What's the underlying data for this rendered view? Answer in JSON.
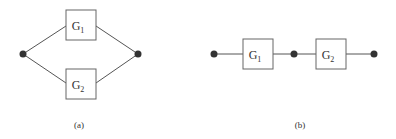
{
  "colors": {
    "line": "#555555",
    "node": "#333333",
    "box_stroke": "#666666",
    "box_fill": "#ffffff",
    "text": "#333333"
  },
  "diagram_a": {
    "caption": "(a)",
    "type": "parallel",
    "blocks": [
      {
        "main": "G",
        "sub": "1"
      },
      {
        "main": "G",
        "sub": "2"
      }
    ],
    "nodes": [
      "input-node",
      "output-node"
    ]
  },
  "diagram_b": {
    "caption": "(b)",
    "type": "series",
    "blocks": [
      {
        "main": "G",
        "sub": "1"
      },
      {
        "main": "G",
        "sub": "2"
      }
    ],
    "nodes": [
      "input-node",
      "middle-node",
      "output-node"
    ]
  }
}
